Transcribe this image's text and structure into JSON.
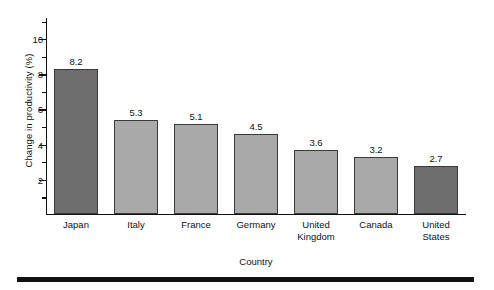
{
  "chart_data": {
    "type": "bar",
    "title": "",
    "xlabel": "Country",
    "ylabel": "Change in productivity (%)",
    "categories": [
      "Japan",
      "Italy",
      "France",
      "Germany",
      "United Kingdom",
      "Canada",
      "United States"
    ],
    "category_lines": [
      [
        "Japan"
      ],
      [
        "Italy"
      ],
      [
        "France"
      ],
      [
        "Germany"
      ],
      [
        "United",
        "Kingdom"
      ],
      [
        "Canada"
      ],
      [
        "United",
        "States"
      ]
    ],
    "values": [
      8.2,
      5.3,
      5.1,
      4.5,
      3.6,
      3.2,
      2.7
    ],
    "value_labels": [
      "8.2",
      "5.3",
      "5.1",
      "4.5",
      "3.6",
      "3.2",
      "2.7"
    ],
    "bar_colors": [
      "#6e6e6e",
      "#a9a9a9",
      "#a9a9a9",
      "#a9a9a9",
      "#a9a9a9",
      "#a9a9a9",
      "#6e6e6e"
    ],
    "bar_edge_color": "#3a3a3a",
    "ylim": [
      0,
      11.2
    ],
    "y_major_ticks": [
      2,
      4,
      6,
      8,
      10
    ],
    "y_major_tick_labels": [
      "2",
      "4",
      "6",
      "8",
      "10"
    ],
    "y_minor_ticks": [
      1,
      3,
      5,
      7,
      9,
      11
    ],
    "grid": false,
    "legend": false
  },
  "figure": {
    "background": "#ffffff",
    "axis_color": "#111111",
    "rule_color": "#111111"
  }
}
